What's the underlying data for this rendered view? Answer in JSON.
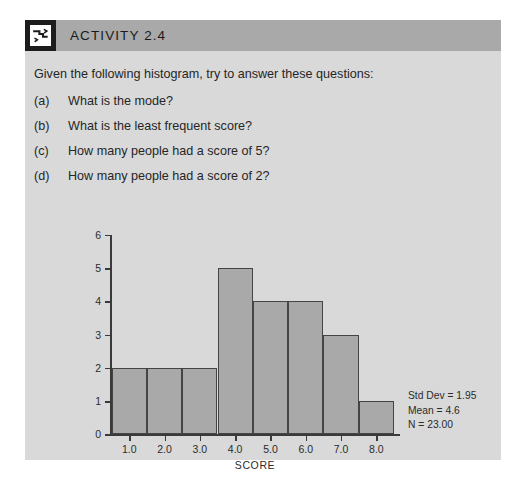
{
  "card": {
    "header": {
      "icon_name": "activity-zigzag-icon",
      "title": "ACTIVITY 2.4",
      "band_color": "#a9a9a9",
      "icon_bg_color": "#1c1c1c"
    },
    "background_color": "#d9d9d9",
    "intro": "Given the following histogram, try to answer these questions:",
    "questions": [
      {
        "label": "(a)",
        "text": "What is the mode?"
      },
      {
        "label": "(b)",
        "text": "What is the least frequent score?"
      },
      {
        "label": "(c)",
        "text": "How many people had a score of 5?"
      },
      {
        "label": "(d)",
        "text": "How many people had a score of 2?"
      }
    ]
  },
  "stats": {
    "std_dev": "Std Dev = 1.95",
    "mean": "Mean = 4.6",
    "n": "N = 23.00"
  },
  "chart_data": {
    "type": "bar",
    "title": "",
    "subtitle": "",
    "xlabel": "SCORE",
    "ylabel": "",
    "categories": [
      "1.0",
      "2.0",
      "3.0",
      "4.0",
      "5.0",
      "6.0",
      "7.0",
      "8.0"
    ],
    "values": [
      2,
      2,
      2,
      5,
      4,
      4,
      3,
      1
    ],
    "ylim": [
      0,
      6
    ],
    "ytick_labels": [
      "0",
      "1",
      "2",
      "3",
      "4",
      "5",
      "6"
    ],
    "ytick_values": [
      0,
      1,
      2,
      3,
      4,
      5,
      6
    ],
    "xtick_labels": [
      "1.0",
      "2.0",
      "3.0",
      "4.0",
      "5.0",
      "6.0",
      "7.0",
      "8.0"
    ],
    "grid": false,
    "legend": null,
    "bar_fill_color": "#a9a9a9",
    "bar_edge_color": "#444444",
    "plot_background_color": "#d9d9d9",
    "annotations": [
      "Std Dev = 1.95",
      "Mean = 4.6",
      "N = 23.00"
    ]
  }
}
